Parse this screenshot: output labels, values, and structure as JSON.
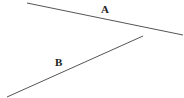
{
  "diagram": {
    "lines": [
      {
        "label": "A",
        "x1": 27,
        "y1": 3,
        "x2": 183,
        "y2": 35,
        "label_x": 101,
        "label_y": 13
      },
      {
        "label": "B",
        "x1": 7,
        "y1": 97,
        "x2": 143,
        "y2": 36,
        "label_x": 55,
        "label_y": 66
      }
    ],
    "stroke_color": "#555555"
  }
}
